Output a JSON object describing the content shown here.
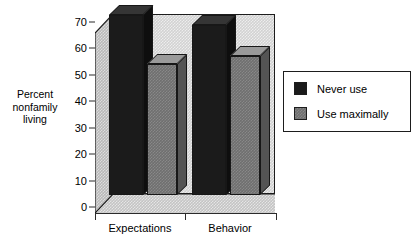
{
  "chart_data": {
    "type": "bar",
    "title": "",
    "subtitle": "",
    "xlabel": "",
    "ylabel": "Percent nonfamily living",
    "ylabel_lines": [
      "Percent",
      "nonfamily",
      "living"
    ],
    "categories": [
      "Expectations",
      "Behavior"
    ],
    "series": [
      {
        "name": "Never use",
        "color": "#1b1b1b",
        "values": [
          70,
          66
        ]
      },
      {
        "name": "Use maximally",
        "color": "#6f6f6f",
        "values": [
          51,
          54
        ]
      }
    ],
    "ylim": [
      0,
      70
    ],
    "yticks": [
      0,
      10,
      20,
      30,
      40,
      50,
      60,
      70
    ],
    "ytick_labels": [
      "0",
      "10",
      "20",
      "30",
      "40",
      "50",
      "60",
      "70"
    ],
    "grid": false,
    "three_d": true,
    "legend_position": "right",
    "legend_entries": [
      "Never use",
      "Use maximally"
    ],
    "annotations": [],
    "colors": {
      "never_use": "#1b1b1b",
      "use_maximally": "#6f6f6f",
      "back_wall": "#d2d2d2",
      "side_wall": "#b9b9b9",
      "floor": "#c4c4c4",
      "axis": "#2b2b2b",
      "background": "#ffffff"
    }
  }
}
